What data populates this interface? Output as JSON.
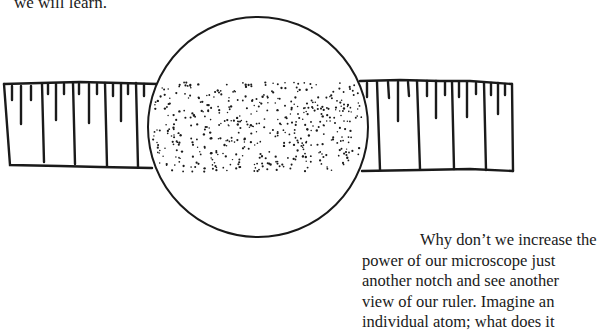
{
  "page": {
    "top_text": "we will learn.",
    "paragraph_lines": [
      "Why don’t we increase the",
      "power of our microscope just",
      "another notch and see another",
      "view of our ruler. Imagine an",
      "individual atom; what does it"
    ]
  },
  "figure": {
    "ink_color": "#1a1a1a",
    "lens": {
      "cx": 258,
      "cy": 127,
      "r": 110
    }
  }
}
